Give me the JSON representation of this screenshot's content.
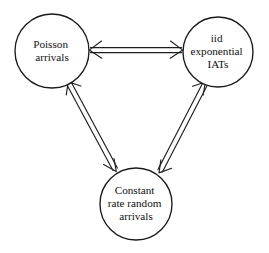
{
  "diagram": {
    "background_color": "#ffffff",
    "stroke_color": "#1f1f1f",
    "text_color": "#111111",
    "nodes": [
      {
        "id": "poisson-arrivals",
        "lines": [
          "Poisson",
          "arrivals"
        ],
        "line1": "Poisson",
        "line2": "arrivals",
        "line3": "",
        "cx": 52,
        "cy": 51,
        "r": 37
      },
      {
        "id": "iid-exponential-iats",
        "lines": [
          "iid",
          "exponential",
          "IATs"
        ],
        "line1": "iid",
        "line2": "exponential",
        "line3": "IATs",
        "cx": 218,
        "cy": 52,
        "r": 35
      },
      {
        "id": "constant-rate-random-arrivals",
        "lines": [
          "Constant",
          "rate random",
          "arrivals"
        ],
        "line1": "Constant",
        "line2": "rate random",
        "line3": "arrivals",
        "cx": 136,
        "cy": 204,
        "r": 36
      }
    ],
    "edges": [
      {
        "id": "edge-poisson-iid",
        "from": "poisson-arrivals",
        "to": "iid-exponential-iats",
        "direction": "bidirectional",
        "style": "double-line"
      },
      {
        "id": "edge-poisson-constant",
        "from": "poisson-arrivals",
        "to": "constant-rate-random-arrivals",
        "direction": "bidirectional",
        "style": "double-line"
      },
      {
        "id": "edge-iid-constant",
        "from": "iid-exponential-iats",
        "to": "constant-rate-random-arrivals",
        "direction": "bidirectional",
        "style": "double-line"
      }
    ]
  }
}
